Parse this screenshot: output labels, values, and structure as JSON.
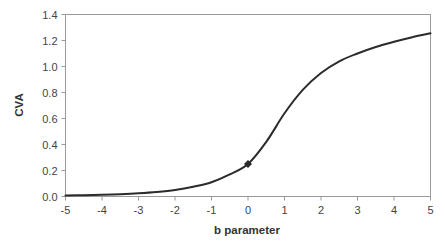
{
  "chart_data": {
    "type": "line",
    "title": "",
    "xlabel": "b parameter",
    "ylabel": "CVA",
    "xlim": [
      -5,
      5
    ],
    "ylim": [
      0,
      1.4
    ],
    "x_ticks": [
      -5,
      -4,
      -3,
      -2,
      -1,
      0,
      1,
      2,
      3,
      4,
      5
    ],
    "x_tick_labels": [
      "-5",
      "-4",
      "-3",
      "-2",
      "-1",
      "0",
      "1",
      "2",
      "3",
      "4",
      "5"
    ],
    "y_ticks": [
      0,
      0.2,
      0.4,
      0.6,
      0.8,
      1.0,
      1.2,
      1.4
    ],
    "y_tick_labels": [
      "0.0",
      "0.2",
      "0.4",
      "0.6",
      "0.8",
      "1.0",
      "1.2",
      "1.4"
    ],
    "grid": false,
    "legend": null,
    "series": [
      {
        "name": "CVA",
        "x": [
          -5,
          -4.5,
          -4,
          -3.5,
          -3,
          -2.5,
          -2,
          -1.5,
          -1,
          -0.5,
          0,
          0.5,
          1,
          1.5,
          2,
          2.5,
          3,
          3.5,
          4,
          4.5,
          5
        ],
        "values": [
          0.008,
          0.01,
          0.013,
          0.018,
          0.025,
          0.035,
          0.05,
          0.075,
          0.11,
          0.17,
          0.25,
          0.42,
          0.64,
          0.82,
          0.95,
          1.04,
          1.1,
          1.15,
          1.19,
          1.225,
          1.255
        ]
      }
    ],
    "annotations": [
      {
        "type": "marker",
        "shape": "diamond",
        "x": 0,
        "y": 0.25
      }
    ]
  },
  "colors": {
    "curve": "#2b2b2b",
    "frame": "#9a9a9a",
    "text": "#333333"
  }
}
